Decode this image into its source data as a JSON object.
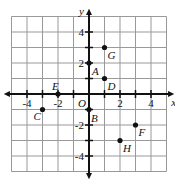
{
  "diagram": {
    "type": "coordinate-plane",
    "axes": {
      "x_label": "x",
      "y_label": "y",
      "origin_label": "O",
      "x_ticks": [
        "-4",
        "-2",
        "2",
        "4"
      ],
      "y_ticks": [
        "4",
        "2",
        "-2",
        "-4"
      ]
    },
    "points": [
      {
        "label": "A",
        "x": 0,
        "y": 2
      },
      {
        "label": "B",
        "x": 0,
        "y": -1
      },
      {
        "label": "C",
        "x": -3,
        "y": -1
      },
      {
        "label": "D",
        "x": 1,
        "y": 1
      },
      {
        "label": "E",
        "x": -2,
        "y": 0
      },
      {
        "label": "F",
        "x": 3,
        "y": -2
      },
      {
        "label": "G",
        "x": 1,
        "y": 3
      },
      {
        "label": "H",
        "x": 2,
        "y": -3
      }
    ]
  }
}
